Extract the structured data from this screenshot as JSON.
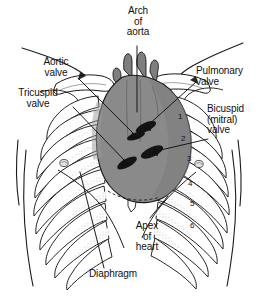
{
  "figure": {
    "background_color": "#ffffff"
  },
  "colors": {
    "outline": "#1a1a1a",
    "heart_fill": "#8a8a8a",
    "heart_fill_dark": "#6f6f6f",
    "valve_marker": "#141414",
    "cartilage_shade": "#c9c9c9",
    "rib_fill": "#ffffff",
    "text": "#101010"
  },
  "labels": {
    "arch_of_aorta": "Arch\nof\naorta",
    "aortic_valve": "Aortic\nvalve",
    "tricuspid_valve": "Tricuspid\nvalve",
    "pulmonary_valve": "Pulmonary\nvalve",
    "bicuspid_valve": "Bicuspid\n(mitral)\nvalve",
    "apex_of_heart": "Apex\nof\nheart",
    "diaphragm": "Diaphragm"
  },
  "rib_numbers": [
    {
      "id": "rib-1",
      "text": "1"
    },
    {
      "id": "rib-2",
      "text": "2"
    },
    {
      "id": "rib-3",
      "text": "3"
    },
    {
      "id": "rib-4",
      "text": "4"
    },
    {
      "id": "rib-5",
      "text": "5"
    },
    {
      "id": "rib-6",
      "text": "6"
    }
  ]
}
